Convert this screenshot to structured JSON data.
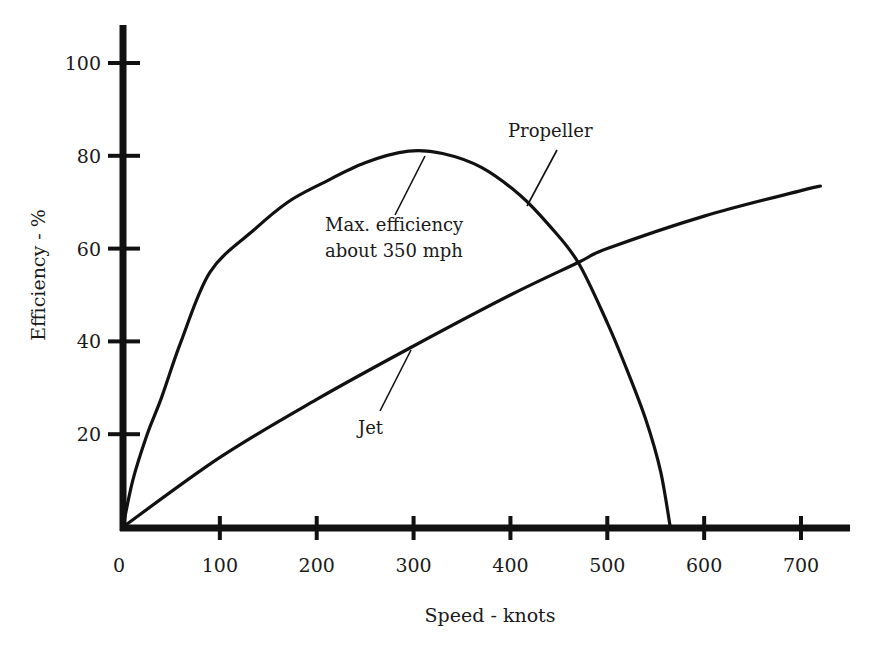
{
  "chart_data": {
    "type": "line",
    "title": "",
    "xlabel": "Speed - knots",
    "ylabel": "Efficiency - %",
    "xlim": [
      0,
      750
    ],
    "ylim": [
      0,
      108
    ],
    "grid": false,
    "legend": "none (curves labeled inline)",
    "x_ticks": [
      0,
      100,
      200,
      300,
      400,
      500,
      600,
      700
    ],
    "y_ticks": [
      20,
      40,
      60,
      80,
      100
    ],
    "series": [
      {
        "name": "Propeller",
        "x": [
          0,
          10,
          25,
          40,
          60,
          90,
          135,
          170,
          205,
          250,
          295,
          330,
          370,
          410,
          440,
          470,
          500,
          520,
          540,
          555,
          565
        ],
        "y": [
          0,
          10,
          20,
          28,
          40,
          55,
          64,
          70,
          74,
          78.5,
          81,
          80.5,
          77.5,
          71.5,
          65,
          57,
          44,
          34,
          23,
          12,
          0
        ]
      },
      {
        "name": "Jet",
        "x": [
          0,
          100,
          200,
          300,
          400,
          470,
          500,
          600,
          700,
          720
        ],
        "y": [
          0,
          15,
          27.5,
          39,
          50,
          57,
          60,
          67,
          72.5,
          73.5
        ]
      }
    ],
    "annotations": [
      {
        "text": "Propeller",
        "target_series": "Propeller",
        "at": [
          415,
          70
        ]
      },
      {
        "text": "Max. efficiency about 350 mph",
        "target_series": "Propeller",
        "at": [
          310,
          80.5
        ]
      },
      {
        "text": "Jet",
        "target_series": "Jet",
        "at": [
          300,
          39
        ]
      }
    ],
    "intersection": {
      "x": 470,
      "y": 57
    }
  },
  "labels": {
    "xlabel": "Speed - knots",
    "ylabel": "Efficiency - %",
    "propeller": "Propeller",
    "max_eff_line1": "Max. efficiency",
    "max_eff_line2": "about 350 mph",
    "jet": "Jet"
  },
  "style": {
    "ink": "#111111",
    "background": "#ffffff"
  }
}
